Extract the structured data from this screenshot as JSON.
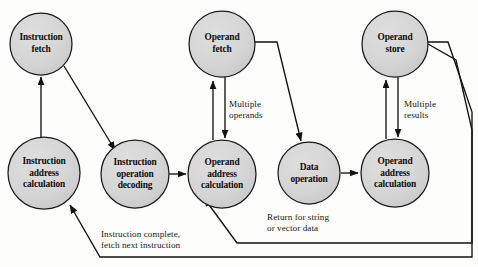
{
  "figure": {
    "kind": "instruction-cycle-state-diagram",
    "width": 478,
    "height": 267,
    "background_color": "#fdfdfc",
    "node_fill_color": "#d4d4d4",
    "node_stroke_color": "#1a1a1a",
    "edge_color": "#111111"
  },
  "nodes": [
    {
      "id": "instruction-fetch",
      "label": "Instruction\nfetch",
      "cx": 41,
      "cy": 44,
      "r": 31
    },
    {
      "id": "operand-fetch",
      "label": "Operand\nfetch",
      "cx": 222,
      "cy": 44,
      "r": 33
    },
    {
      "id": "operand-store",
      "label": "Operand\nstore",
      "cx": 395,
      "cy": 44,
      "r": 33
    },
    {
      "id": "instruction-address-calculation",
      "label": "Instruction\naddress\ncalculation",
      "cx": 44,
      "cy": 173,
      "r": 36
    },
    {
      "id": "instruction-operation-decoding",
      "label": "Instruction\noperation\ndecoding",
      "cx": 135,
      "cy": 174,
      "r": 34
    },
    {
      "id": "operand-address-calculation-left",
      "label": "Operand\naddress\ncalculation",
      "cx": 222,
      "cy": 174,
      "r": 34
    },
    {
      "id": "data-operation",
      "label": "Data\noperation",
      "cx": 309,
      "cy": 173,
      "r": 31
    },
    {
      "id": "operand-address-calculation-right",
      "label": "Operand\naddress\ncalculation",
      "cx": 395,
      "cy": 173,
      "r": 34
    }
  ],
  "edge_labels": [
    {
      "id": "multiple-operands",
      "text": "Multiple\noperands",
      "x": 229,
      "y": 99
    },
    {
      "id": "multiple-results",
      "text": "Multiple\nresults",
      "x": 404,
      "y": 99
    },
    {
      "id": "return-for-string-or-vector-data",
      "text": "Return for string\nor vector data",
      "x": 267,
      "y": 212
    },
    {
      "id": "instruction-complete-fetch-next-instruction",
      "text": "Instruction complete,\nfetch next instruction",
      "x": 101,
      "y": 229
    }
  ],
  "edges": [
    {
      "id": "instruction-address-calculation-to-instruction-fetch",
      "from": "instruction-address-calculation",
      "to": "instruction-fetch"
    },
    {
      "id": "instruction-fetch-to-instruction-operation-decoding",
      "from": "instruction-fetch",
      "to": "instruction-operation-decoding"
    },
    {
      "id": "instruction-operation-decoding-to-operand-address-calculation-left",
      "from": "instruction-operation-decoding",
      "to": "operand-address-calculation-left"
    },
    {
      "id": "operand-address-calculation-left-to-operand-fetch",
      "from": "operand-address-calculation-left",
      "to": "operand-fetch"
    },
    {
      "id": "operand-fetch-to-operand-address-calculation-left-multiple-operands",
      "from": "operand-fetch",
      "to": "operand-address-calculation-left"
    },
    {
      "id": "operand-fetch-to-data-operation",
      "from": "operand-fetch",
      "to": "data-operation"
    },
    {
      "id": "data-operation-to-operand-address-calculation-right",
      "from": "data-operation",
      "to": "operand-address-calculation-right"
    },
    {
      "id": "operand-address-calculation-right-to-operand-store",
      "from": "operand-address-calculation-right",
      "to": "operand-store"
    },
    {
      "id": "operand-store-to-operand-address-calculation-right-multiple-results",
      "from": "operand-store",
      "to": "operand-address-calculation-right"
    },
    {
      "id": "return-for-string-or-vector-data-edge",
      "from": "operand-store",
      "to": "operand-address-calculation-left"
    },
    {
      "id": "instruction-complete-fetch-next-instruction-edge",
      "from": "operand-store",
      "to": "instruction-address-calculation"
    }
  ]
}
